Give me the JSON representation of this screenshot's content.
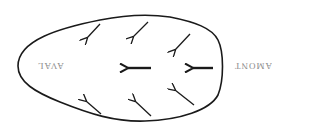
{
  "diagram": {
    "labels": {
      "left": "AVAL",
      "right": "AMONT"
    },
    "label_orientation": "rotated-180",
    "colors": {
      "outline": "#1a1a1a",
      "arrows": "#1a1a1a",
      "label": "#8a8a8a",
      "background": "#ffffff"
    },
    "shape": "egg-outline",
    "arrows": [
      {
        "name": "top-left",
        "from": [
          100,
          24
        ],
        "to": [
          86,
          39
        ],
        "weight": "thin"
      },
      {
        "name": "top-middle",
        "from": [
          148,
          22
        ],
        "to": [
          132,
          38
        ],
        "weight": "thin"
      },
      {
        "name": "top-right",
        "from": [
          190,
          34
        ],
        "to": [
          174,
          51
        ],
        "weight": "thin"
      },
      {
        "name": "center",
        "from": [
          151,
          68
        ],
        "to": [
          127,
          68
        ],
        "weight": "bold"
      },
      {
        "name": "right",
        "from": [
          213,
          68
        ],
        "to": [
          192,
          68
        ],
        "weight": "bold"
      },
      {
        "name": "bottom-left",
        "from": [
          101,
          114
        ],
        "to": [
          85,
          100
        ],
        "weight": "thin"
      },
      {
        "name": "bottom-middle",
        "from": [
          151,
          116
        ],
        "to": [
          134,
          100
        ],
        "weight": "thin"
      },
      {
        "name": "bottom-right",
        "from": [
          194,
          105
        ],
        "to": [
          174,
          89
        ],
        "weight": "thin"
      }
    ]
  }
}
